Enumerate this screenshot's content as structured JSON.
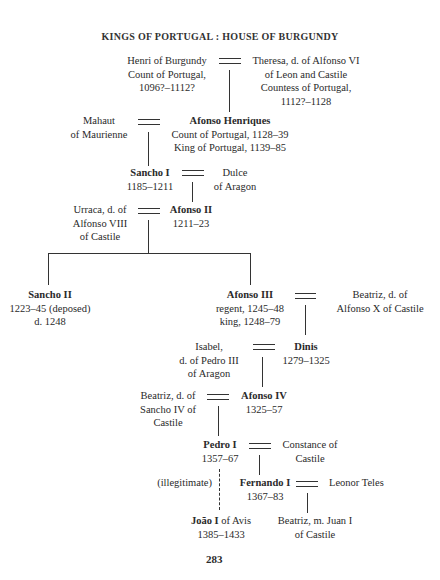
{
  "title": "KINGS OF PORTUGAL : HOUSE OF BURGUNDY",
  "people": {
    "henri": {
      "name": "Henri of Burgundy",
      "line2": "Count of Portugal,",
      "line3": "1096?–1112?"
    },
    "theresa": {
      "line1": "Theresa, d. of Alfonso VI",
      "line2": "of Leon and Castile",
      "line3": "Countess of Portugal,",
      "line4": "1112?–1128"
    },
    "mahaut": {
      "line1": "Mahaut",
      "line2": "of Maurienne"
    },
    "afonso_henriques": {
      "name": "Afonso Henriques",
      "line2": "Count of Portugal, 1128–39",
      "line3": "King of Portugal, 1139–85"
    },
    "sancho1": {
      "name": "Sancho I",
      "dates": "1185–1211"
    },
    "dulce": {
      "line1": "Dulce",
      "line2": "of Aragon"
    },
    "urraca": {
      "line1": "Urraca, d. of",
      "line2": "Alfonso VIII",
      "line3": "of Castile"
    },
    "afonso2": {
      "name": "Afonso II",
      "dates": "1211–23"
    },
    "sancho2": {
      "name": "Sancho II",
      "line2": "1223–45 (deposed)",
      "line3": "d. 1248"
    },
    "afonso3": {
      "name": "Afonso III",
      "line2": "regent, 1245–48",
      "line3": "king, 1248–79"
    },
    "beatriz_x": {
      "line1": "Beatriz, d. of",
      "line2": "Alfonso X of Castile"
    },
    "isabel": {
      "line1": "Isabel,",
      "line2": "d. of Pedro III",
      "line3": "of Aragon"
    },
    "dinis": {
      "name": "Dinis",
      "dates": "1279–1325"
    },
    "beatriz_iv": {
      "line1": "Beatriz, d. of",
      "line2": "Sancho IV of",
      "line3": "Castile"
    },
    "afonso4": {
      "name": "Afonso IV",
      "dates": "1325–57"
    },
    "pedro1": {
      "name": "Pedro I",
      "dates": "1357–67"
    },
    "constance": {
      "line1": "Constance of",
      "line2": "Castile"
    },
    "illegitimate": "(illegitimate)",
    "fernando1": {
      "name": "Fernando I",
      "dates": "1367–83"
    },
    "leonor": {
      "line1": "Leonor Teles"
    },
    "joao1": {
      "name": "João I",
      "suffix": " of Avis",
      "dates": "1385–1433"
    },
    "beatriz_juan": {
      "line1": "Beatriz, m. Juan I",
      "line2": "of Castile"
    }
  },
  "page_number": "283"
}
